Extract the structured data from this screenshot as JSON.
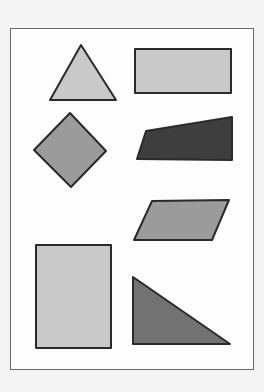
{
  "figure": {
    "colors": {
      "background": "#f4f4f4",
      "frame_fill": "#fdfdfd",
      "frame_border": "#6a6a6a",
      "outline": "#2a2a2a",
      "light": "#c9c9c9",
      "medium": "#9b9b9b",
      "dark_medium": "#727272",
      "dark": "#3e3e3e"
    },
    "shapes": [
      {
        "name": "triangle",
        "shade": "light",
        "points": "81,45 116,100 50,100"
      },
      {
        "name": "wide-rectangle",
        "shade": "light",
        "points": "135,49 231,49 231,93 135,93"
      },
      {
        "name": "square-diamond",
        "shade": "medium",
        "points": "70,113 106,151 71,187 34,150"
      },
      {
        "name": "trapezoid",
        "shade": "dark",
        "points": "146,131 232,117 232,160 137,159"
      },
      {
        "name": "parallelogram",
        "shade": "medium",
        "points": "152,201 229,200 212,240 134,240"
      },
      {
        "name": "tall-rectangle",
        "shade": "light",
        "points": "36,245 111,245 111,348 36,348"
      },
      {
        "name": "right-triangle",
        "shade": "dark_medium",
        "points": "133,277 230,344 133,344"
      }
    ]
  }
}
